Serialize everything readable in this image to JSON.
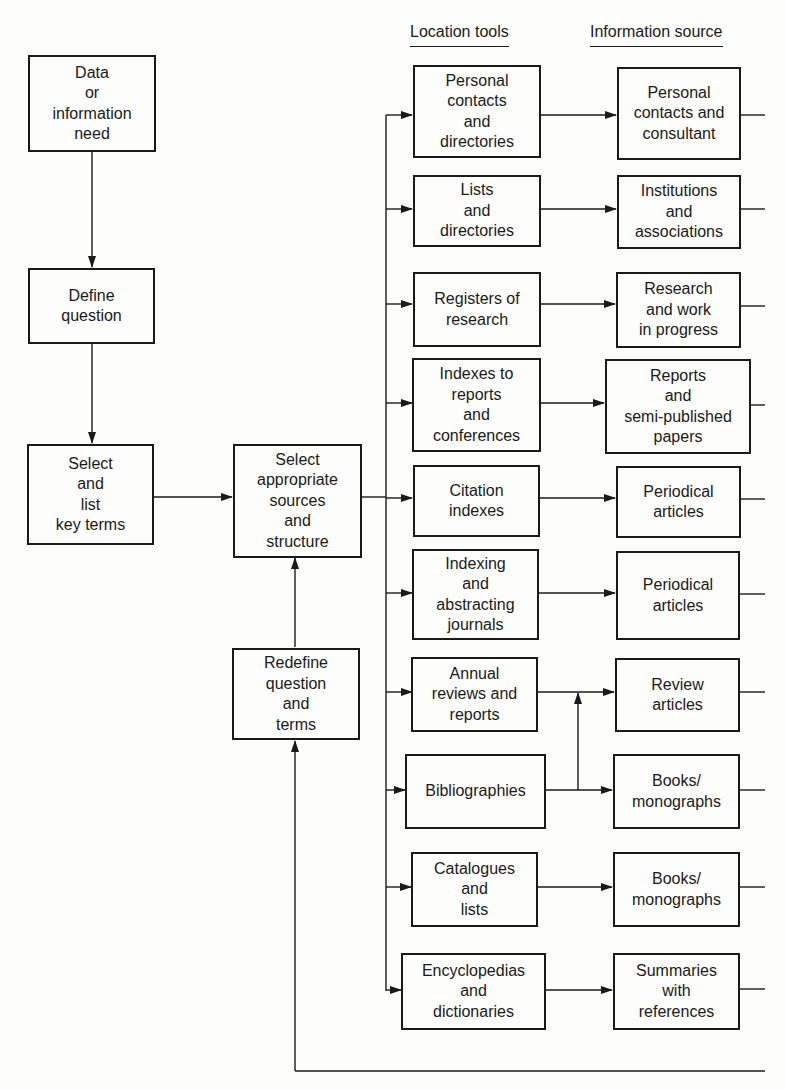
{
  "diagram": {
    "type": "flowchart",
    "column_headers": {
      "location_tools": "Location tools",
      "information_source": "Information source"
    },
    "process_steps": [
      {
        "id": "need",
        "label": "Data\nor\ninformation\nneed"
      },
      {
        "id": "define",
        "label": "Define\nquestion"
      },
      {
        "id": "select_terms",
        "label": "Select\nand\nlist\nkey terms"
      },
      {
        "id": "select_sources",
        "label": "Select\nappropriate\nsources\nand\nstructure"
      },
      {
        "id": "redefine",
        "label": "Redefine\nquestion\nand\nterms"
      }
    ],
    "rows": [
      {
        "tool": "Personal\ncontacts\nand\ndirectories",
        "source": "Personal\ncontacts and\nconsultant"
      },
      {
        "tool": "Lists\nand\ndirectories",
        "source": "Institutions\nand\nassociations"
      },
      {
        "tool": "Registers of\nresearch",
        "source": "Research\nand work\nin progress"
      },
      {
        "tool": "Indexes to\nreports\nand\nconferences",
        "source": "Reports\nand\nsemi-published\npapers"
      },
      {
        "tool": "Citation\nindexes",
        "source": "Periodical\narticles"
      },
      {
        "tool": "Indexing\nand\nabstracting\njournals",
        "source": "Periodical\narticles"
      },
      {
        "tool": "Annual\nreviews and\nreports",
        "source": "Review\narticles"
      },
      {
        "tool": "Bibliographies",
        "source": "Books/\nmonographs"
      },
      {
        "tool": "Catalogues\nand\nlists",
        "source": "Books/\nmonographs"
      },
      {
        "tool": "Encyclopedias\nand\ndictionaries",
        "source": "Summaries\nwith\nreferences"
      }
    ],
    "edges": [
      {
        "from": "Data or information need",
        "to": "Define question"
      },
      {
        "from": "Define question",
        "to": "Select and list key terms"
      },
      {
        "from": "Select and list key terms",
        "to": "Select appropriate sources and structure"
      },
      {
        "from": "Select appropriate sources and structure",
        "to": "all location tools"
      },
      {
        "from": "each location tool",
        "to": "its information source"
      },
      {
        "from": "Bibliographies",
        "to": "Review articles"
      },
      {
        "from": "all information sources",
        "to": "Redefine question and terms"
      },
      {
        "from": "Redefine question and terms",
        "to": "Select appropriate sources and structure"
      }
    ],
    "colors": {
      "ink": "#1a1a1a",
      "paper": "#fdfdfc"
    }
  }
}
